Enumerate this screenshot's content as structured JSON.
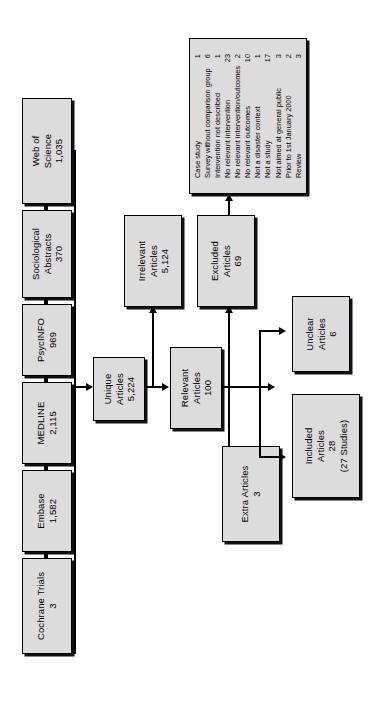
{
  "diagram": {
    "orientation": "rotated-90-ccw",
    "box_fill": "#dcdcdc",
    "box_border": "#000000"
  },
  "sources": [
    {
      "name": "Web of Science",
      "line1": "Web of",
      "line2": "Science",
      "count": "1,035"
    },
    {
      "name": "Sociological Abstracts",
      "line1": "Sociological",
      "line2": "Abstracts",
      "count": "370"
    },
    {
      "name": "PsycINFO",
      "line1": "PsycINFO",
      "line2": "",
      "count": "969"
    },
    {
      "name": "MEDLINE",
      "line1": "MEDLINE",
      "line2": "",
      "count": "2,115"
    },
    {
      "name": "Embase",
      "line1": "Embase",
      "line2": "",
      "count": "1,582"
    },
    {
      "name": "Cochrane Trials",
      "line1": "Cochrane Trials",
      "line2": "",
      "count": "3"
    }
  ],
  "stages": {
    "unique": {
      "line1": "Unique",
      "line2": "Articles",
      "count": "5,224"
    },
    "relevant": {
      "line1": "Relevant",
      "line2": "Articles",
      "count": "100"
    },
    "irrelevant": {
      "line1": "Irrelevant",
      "line2": "Articles",
      "count": "5,124"
    },
    "excluded": {
      "line1": "Excluded",
      "line2": "Articles",
      "count": "69"
    },
    "extra": {
      "line1": "Extra Articles",
      "line2": "",
      "count": "3"
    },
    "unclear": {
      "line1": "Unclear",
      "line2": "Articles",
      "count": "6"
    },
    "included": {
      "line1": "Included",
      "line2": "Articles",
      "count": "28",
      "note": "(27 Studies)"
    }
  },
  "exclusion_reasons": [
    {
      "label": "Case study",
      "count": "1"
    },
    {
      "label": "Survey without comparison group",
      "count": "6"
    },
    {
      "label": "Intervention not described",
      "count": "1"
    },
    {
      "label": "No relevant intervention",
      "count": "23"
    },
    {
      "label": "No relevant intervention/outcomes",
      "count": "2"
    },
    {
      "label": "No relevant outcomes",
      "count": "10"
    },
    {
      "label": "Not a disaster context",
      "count": "1"
    },
    {
      "label": "Not a study",
      "count": "17"
    },
    {
      "label": "Not aimed at general public",
      "count": "3"
    },
    {
      "label": "Prior to 1st January 2000",
      "count": "2"
    },
    {
      "label": "Review",
      "count": "3"
    }
  ]
}
